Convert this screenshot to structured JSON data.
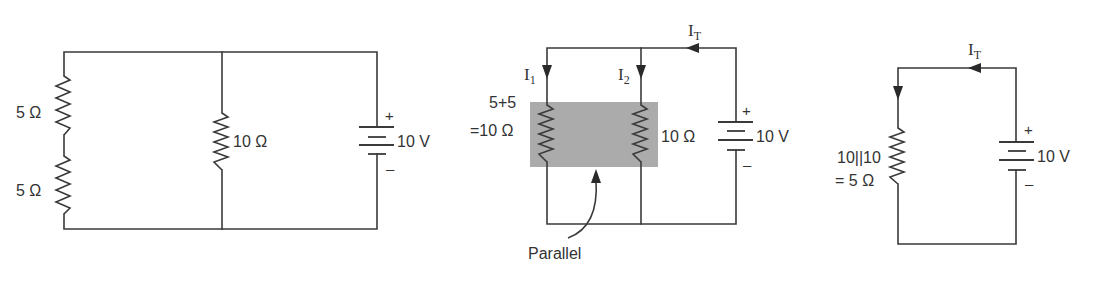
{
  "diagram": {
    "colors": {
      "wire": "#3a3a3a",
      "text": "#333333",
      "shade": "#ababab",
      "background": "#ffffff"
    },
    "circuit1": {
      "resistors": [
        {
          "label": "5 Ω",
          "position": "left-top"
        },
        {
          "label": "5 Ω",
          "position": "left-bottom"
        },
        {
          "label": "10 Ω",
          "position": "middle"
        }
      ],
      "source": {
        "label": "10 V",
        "plus": "+",
        "minus": "–"
      }
    },
    "circuit2": {
      "left_label_line1": "5+5",
      "left_label_line2": "=10 Ω",
      "right_resistor_label": "10 Ω",
      "currents": {
        "i1": "I",
        "i1_sub": "1",
        "i2": "I",
        "i2_sub": "2",
        "it": "I",
        "it_sub": "T"
      },
      "source": {
        "label": "10 V",
        "plus": "+",
        "minus": "–"
      },
      "annotation": "Parallel"
    },
    "circuit3": {
      "resistor_label_line1": "10||10",
      "resistor_label_line2": "= 5 Ω",
      "currents": {
        "it": "I",
        "it_sub": "T"
      },
      "source": {
        "label": "10 V",
        "plus": "+",
        "minus": "–"
      }
    }
  }
}
